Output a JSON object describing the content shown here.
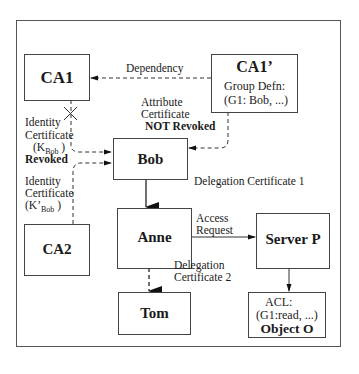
{
  "diagram": {
    "nodes": {
      "ca1": {
        "title": "CA1"
      },
      "ca1prime": {
        "title": "CA1’",
        "line1": "Group Defn:",
        "line2": "(G1: Bob, ...)"
      },
      "bob": {
        "title": "Bob"
      },
      "ca2": {
        "title": "CA2"
      },
      "anne": {
        "title": "Anne"
      },
      "server": {
        "title": "Server P"
      },
      "tom": {
        "title": "Tom"
      },
      "object": {
        "line1": "ACL:",
        "line2": "(G1:read, ...)",
        "title": "Object O"
      }
    },
    "edges": {
      "dependency": {
        "label": "Dependency",
        "style": "dashed"
      },
      "attribute_cert": {
        "line1": "Attribute",
        "line2": "Certificate",
        "line3": "NOT Revoked",
        "style": "dashed"
      },
      "identity_cert_1": {
        "line1": "Identity",
        "line2": "Certificate",
        "line3_open": "(K",
        "line3_sub": "Bob",
        "line3_close": " )",
        "line4": "Revoked",
        "style": "dashed",
        "crossed": true
      },
      "identity_cert_2": {
        "line1": "Identity",
        "line2": "Certificate",
        "line3_open": "(K’",
        "line3_sub": "Bob",
        "line3_close": " )",
        "style": "dashed"
      },
      "delegation_1": {
        "label": "Delegation Certificate 1",
        "style": "solid"
      },
      "access_request": {
        "line1": "Access",
        "line2": "Request",
        "style": "solid"
      },
      "delegation_2": {
        "line1": "Delegation",
        "line2": "Certificate 2",
        "style": "dashed"
      },
      "server_to_object": {
        "style": "solid"
      }
    }
  }
}
